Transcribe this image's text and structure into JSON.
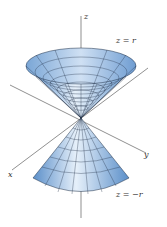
{
  "figure": {
    "labels": {
      "z_axis": "z",
      "y_axis": "y",
      "x_axis": "x",
      "upper_cone": "z = r",
      "lower_cone": "z = −r"
    },
    "colors": {
      "surface_dark": "#5b8fc9",
      "surface_light": "#e6f0fa",
      "mesh": "#1f2f45",
      "axis": "#444444"
    }
  }
}
